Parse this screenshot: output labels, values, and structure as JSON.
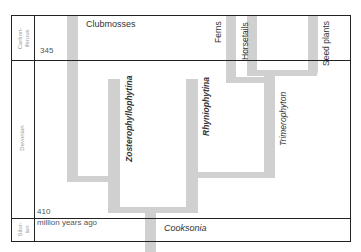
{
  "periods": [
    {
      "name": "Carbon-\niferous",
      "key": "carboniferous"
    },
    {
      "name": "Devonian",
      "key": "devonian"
    },
    {
      "name": "Silur-\nian",
      "key": "silurian"
    }
  ],
  "ages": {
    "top": "345",
    "mid": "410",
    "unit": "million years ago"
  },
  "lineages": {
    "clubmosses": "Clubmosses",
    "zosterophyllophytina": "Zosterophyllophytina",
    "rhyniophytina": "Rhyniophytina",
    "trimerophyton": "Trimerophyton",
    "ferns": "Ferns",
    "horsetails": "Horsetails",
    "seed_plants": "Seed plants",
    "cooksonia": "Cooksonia"
  },
  "colors": {
    "branch": "#d0d0d0",
    "border": "#222222"
  }
}
